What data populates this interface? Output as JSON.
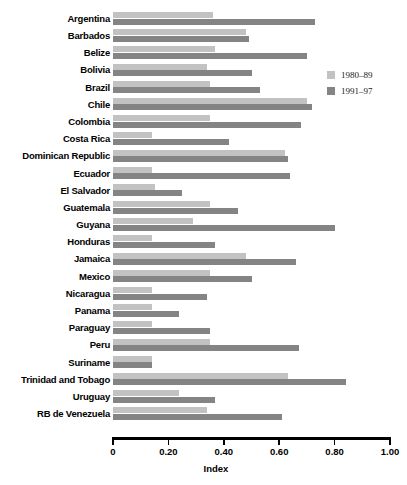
{
  "chart_data": {
    "type": "bar",
    "orientation": "horizontal",
    "title": "",
    "xlabel": "Index",
    "ylabel": "",
    "xlim": [
      0,
      1.0
    ],
    "xticks": [
      "0",
      "0.20",
      "0.40",
      "0.60",
      "0.80",
      "1.00"
    ],
    "xtick_values": [
      0,
      0.2,
      0.4,
      0.6,
      0.8,
      1.0
    ],
    "grid": false,
    "legend_position": "upper right",
    "categories": [
      "Argentina",
      "Barbados",
      "Belize",
      "Bolivia",
      "Brazil",
      "Chile",
      "Colombia",
      "Costa Rica",
      "Dominican Republic",
      "Ecuador",
      "El Salvador",
      "Guatemala",
      "Guyana",
      "Honduras",
      "Jamaica",
      "Mexico",
      "Nicaragua",
      "Panama",
      "Paraguay",
      "Peru",
      "Suriname",
      "Trinidad and Tobago",
      "Uruguay",
      "RB de Venezuela"
    ],
    "series": [
      {
        "name": "1980-89",
        "color": "#c2c2c2",
        "values": [
          0.36,
          0.48,
          0.37,
          0.34,
          0.35,
          0.7,
          0.35,
          0.14,
          0.62,
          0.14,
          0.15,
          0.35,
          0.29,
          0.14,
          0.48,
          0.35,
          0.14,
          0.14,
          0.14,
          0.35,
          0.14,
          0.63,
          0.24,
          0.34
        ]
      },
      {
        "name": "1991-97",
        "color": "#848484",
        "values": [
          0.73,
          0.49,
          0.7,
          0.5,
          0.53,
          0.72,
          0.68,
          0.42,
          0.63,
          0.64,
          0.25,
          0.45,
          0.8,
          0.37,
          0.66,
          0.5,
          0.34,
          0.24,
          0.35,
          0.67,
          0.14,
          0.84,
          0.37,
          0.61
        ]
      }
    ]
  },
  "legend": {
    "items": [
      {
        "label": "1980–89",
        "color": "#c2c2c2"
      },
      {
        "label": "1991–97",
        "color": "#848484"
      }
    ]
  },
  "axis": {
    "title": "Index"
  }
}
